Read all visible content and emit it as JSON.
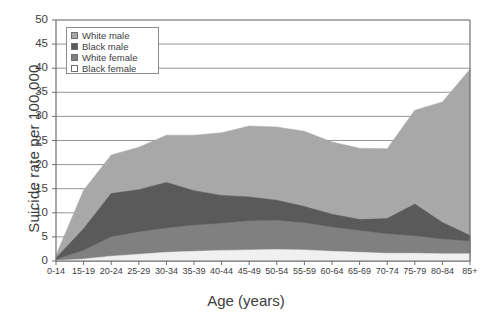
{
  "chart_data": {
    "type": "area",
    "stacked": true,
    "title": "",
    "xlabel": "Age (years)",
    "ylabel": "Suicide rate per 100,000",
    "ylim": [
      0,
      50
    ],
    "ytick_step": 5,
    "yticks": [
      "0",
      "5",
      "10",
      "15",
      "20",
      "25",
      "30",
      "35",
      "40",
      "45",
      "50"
    ],
    "grid": "horizontal",
    "legend_position": "top-left",
    "categories": [
      "0-14",
      "15-19",
      "20-24",
      "25-29",
      "30-34",
      "35-39",
      "40-44",
      "45-49",
      "50-54",
      "55-59",
      "60-64",
      "65-69",
      "70-74",
      "75-79",
      "80-84",
      "85+"
    ],
    "series": [
      {
        "name": "White male",
        "color": "#a8a8a8",
        "values": [
          0.6,
          8.0,
          8.0,
          8.8,
          9.8,
          11.5,
          13.0,
          14.7,
          15.2,
          15.6,
          15.0,
          14.8,
          14.5,
          19.5,
          25.0,
          34.5
        ]
      },
      {
        "name": "Black male",
        "color": "#5a5a5a",
        "values": [
          0.3,
          4.5,
          9.0,
          8.8,
          9.5,
          7.2,
          5.8,
          5.0,
          4.2,
          3.4,
          2.7,
          2.3,
          3.2,
          6.6,
          3.5,
          1.2
        ]
      },
      {
        "name": "White female",
        "color": "#808080",
        "values": [
          0.2,
          1.8,
          4.0,
          4.6,
          5.0,
          5.4,
          5.6,
          6.0,
          6.0,
          5.6,
          5.0,
          4.5,
          4.0,
          3.6,
          3.0,
          2.6
        ]
      },
      {
        "name": "Black female",
        "color": "#f0f0f0",
        "values": [
          0.1,
          0.4,
          1.0,
          1.4,
          1.8,
          2.0,
          2.2,
          2.3,
          2.4,
          2.3,
          2.0,
          1.8,
          1.6,
          1.6,
          1.5,
          1.5
        ]
      }
    ],
    "totals": [
      1.2,
      14.7,
      22.0,
      23.6,
      26.1,
      26.1,
      26.6,
      28.0,
      27.8,
      26.9,
      24.7,
      23.4,
      23.3,
      31.3,
      33.0,
      39.8
    ]
  },
  "legend": {
    "items": [
      {
        "label": "White male"
      },
      {
        "label": "Black male"
      },
      {
        "label": "White female"
      },
      {
        "label": "Black female"
      }
    ]
  },
  "axes": {
    "x_title": "Age (years)",
    "y_title": "Suicide rate per 100,000"
  }
}
